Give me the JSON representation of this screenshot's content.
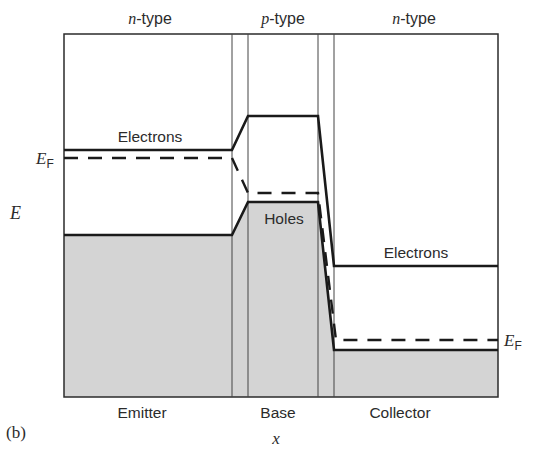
{
  "figure": {
    "panel_label": "(b)",
    "x_axis_label": "x",
    "y_axis_label": "E",
    "colors": {
      "fill_gray": "#d4d4d4",
      "line": "#1a1a1a",
      "frame": "#2b2b2b"
    },
    "regions": [
      {
        "id": "emitter",
        "type_italic": "n",
        "type_suffix": "-type",
        "label": "Emitter"
      },
      {
        "id": "base",
        "type_italic": "p",
        "type_suffix": "-type",
        "label": "Base"
      },
      {
        "id": "collector",
        "type_italic": "n",
        "type_suffix": "-type",
        "label": "Collector"
      }
    ],
    "band_labels": {
      "emitter_electrons": "Electrons",
      "base_holes": "Holes",
      "collector_electrons": "Electrons"
    },
    "fermi_label_main": "E",
    "fermi_label_sub": "F"
  }
}
